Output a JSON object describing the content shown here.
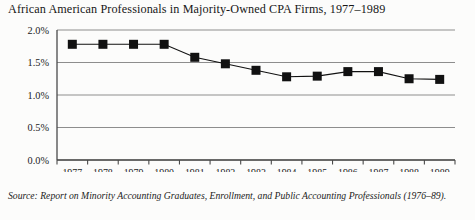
{
  "figure": {
    "title": "African American Professionals in Majority-Owned CPA Firms, 1977–1989",
    "source_label": "Source:",
    "source_text": "Report on Minority Accounting Graduates, Enrollment, and Public Accounting Professionals (1976–89)."
  },
  "chart_data": {
    "type": "line",
    "title": "African American Professionals in Majority-Owned CPA Firms, 1977–1989",
    "xlabel": "",
    "ylabel": "",
    "categories": [
      "1977",
      "1978",
      "1979",
      "1980",
      "1981",
      "1982",
      "1983",
      "1984",
      "1985",
      "1986",
      "1987",
      "1988",
      "1989"
    ],
    "values": [
      1.78,
      1.78,
      1.78,
      1.78,
      1.58,
      1.48,
      1.38,
      1.28,
      1.29,
      1.36,
      1.36,
      1.25,
      1.24
    ],
    "ylim": [
      0.0,
      2.0
    ],
    "ytick_values": [
      2.0,
      1.5,
      1.0,
      0.5,
      0.0
    ],
    "ytick_labels": [
      "2.0%",
      "1.5%",
      "1.0%",
      "0.5%",
      "0.0%"
    ],
    "xtick_labels": [
      "1977",
      "1978",
      "1979",
      "1980",
      "1981",
      "1982",
      "1983",
      "1984",
      "1985",
      "1986",
      "1987",
      "1988",
      "1989"
    ],
    "grid": "horizontal",
    "legend": "none",
    "marker": "square",
    "series_color": "#111111",
    "grid_color": "#8d8d8d",
    "axis_color": "#4a4a4a"
  }
}
